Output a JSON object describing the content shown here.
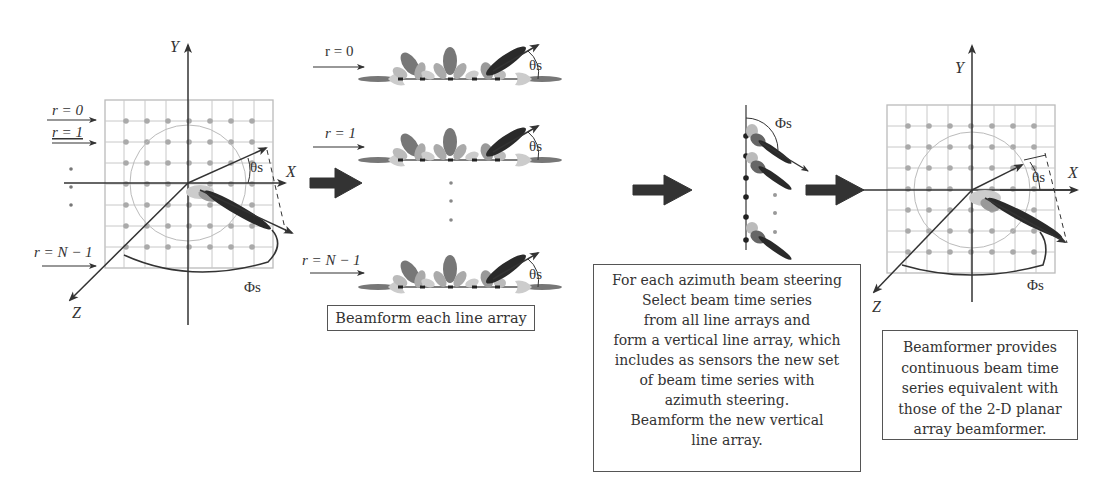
{
  "panel_planar_array": {
    "axis_labels": {
      "y": "Y",
      "x": "X",
      "z": "Z"
    },
    "row_labels": [
      "r = 0",
      "r = 1",
      "r = N − 1"
    ],
    "angle_elevation": "θs",
    "angle_azimuth": "Φs",
    "grid": {
      "rows": 7,
      "cols": 7
    }
  },
  "panel_line_arrays": {
    "row_labels": [
      "r = 0",
      "r = 1",
      "r = N − 1"
    ],
    "angle_label": "θs",
    "caption": "Beamform each line array"
  },
  "panel_vertical_array": {
    "angle_label": "Φs",
    "caption_lines": [
      "For each azimuth beam steering",
      "Select beam time series",
      "from all line arrays and",
      "form a vertical line array, which",
      "includes as sensors the new set",
      "of beam time series with",
      "azimuth steering.",
      "Beamform the new vertical",
      "line array."
    ]
  },
  "panel_result": {
    "axis_labels": {
      "y": "Y",
      "x": "X",
      "z": "Z"
    },
    "angle_elevation": "θs",
    "angle_azimuth": "Φs",
    "caption_lines": [
      "Beamformer provides",
      "continuous beam time",
      "series equivalent with",
      "those of the 2-D planar",
      "array beamformer."
    ]
  },
  "flow_arrows": [
    "planar-to-line-arrays",
    "line-arrays-to-vertical",
    "vertical-to-result"
  ],
  "colors": {
    "axis": "#333333",
    "grid": "#bbbbbb",
    "sensor": "#aaaaaa",
    "main_beam": "#2a2a2a",
    "side_lobe_dark": "#666666",
    "side_lobe_light": "#bbbbbb"
  }
}
